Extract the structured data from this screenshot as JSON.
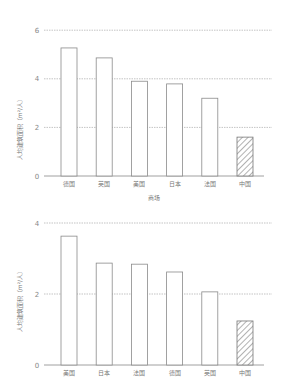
{
  "chart_data": [
    {
      "type": "bar",
      "title": "",
      "xlabel": "商场",
      "ylabel": "人均建筑面积（m²/人）",
      "categories": [
        "德国",
        "英国",
        "美国",
        "日本",
        "法国",
        "中国"
      ],
      "values": [
        5.27,
        4.86,
        3.9,
        3.79,
        3.2,
        1.6
      ],
      "highlight": "中国",
      "highlight_style": "hatched",
      "ylim": [
        0,
        6
      ],
      "yticks": [
        0,
        2,
        4,
        6
      ],
      "grid": "dotted horizontal",
      "legend": "none"
    },
    {
      "type": "bar",
      "title": "",
      "xlabel": "",
      "ylabel": "人均建筑面积（m²/人）",
      "categories": [
        "美国",
        "日本",
        "法国",
        "德国",
        "英国",
        "中国"
      ],
      "values": [
        3.63,
        2.87,
        2.84,
        2.62,
        2.06,
        1.24
      ],
      "highlight": "中国",
      "highlight_style": "hatched",
      "ylim": [
        0,
        4
      ],
      "yticks": [
        0,
        2,
        4
      ],
      "grid": "dotted horizontal",
      "legend": "none"
    }
  ],
  "colors": {
    "bar_fill": "#ffffff",
    "bar_stroke": "#8a8a8a",
    "grid": "#aaaaaa",
    "axis": "#888888",
    "text": "#777777"
  }
}
